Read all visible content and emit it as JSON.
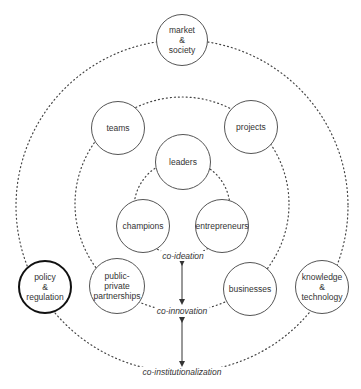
{
  "nodes": [
    {
      "id": "market",
      "label": "market\n&\nsociety",
      "cx": 182,
      "cy": 40,
      "r": 26,
      "thick": false
    },
    {
      "id": "teams",
      "label": "teams",
      "cx": 118,
      "cy": 128,
      "r": 27,
      "thick": false
    },
    {
      "id": "projects",
      "label": "projects",
      "cx": 251,
      "cy": 127,
      "r": 27,
      "thick": false
    },
    {
      "id": "leaders",
      "label": "leaders",
      "cx": 183,
      "cy": 162,
      "r": 28,
      "thick": false
    },
    {
      "id": "champions",
      "label": "champions",
      "cx": 143,
      "cy": 226,
      "r": 27,
      "thick": false
    },
    {
      "id": "entrepreneurs",
      "label": "entrepreneurs",
      "cx": 222,
      "cy": 226,
      "r": 27,
      "thick": false
    },
    {
      "id": "ppp",
      "label": "public-\nprivate\npartnerships",
      "cx": 117,
      "cy": 286,
      "r": 28,
      "thick": false
    },
    {
      "id": "businesses",
      "label": "businesses",
      "cx": 250,
      "cy": 289,
      "r": 27,
      "thick": false
    },
    {
      "id": "policy",
      "label": "policy\n&\nregulation",
      "cx": 45,
      "cy": 287,
      "r": 27,
      "thick": true
    },
    {
      "id": "knowledge",
      "label": "knowledge\n&\ntechnology",
      "cx": 322,
      "cy": 287,
      "r": 27,
      "thick": false
    }
  ],
  "labels": [
    {
      "id": "co-ideation",
      "text": "co-ideation",
      "x": 183,
      "y": 256
    },
    {
      "id": "co-innovation",
      "text": "co-innovation",
      "x": 182,
      "y": 311
    },
    {
      "id": "co-institutionalization",
      "text": "co-institutionalization",
      "x": 182,
      "y": 372
    }
  ],
  "rings": [
    {
      "id": "inner",
      "cx": 182,
      "cy": 208,
      "r": 48
    },
    {
      "id": "middle",
      "cx": 182,
      "cy": 204,
      "r": 107
    },
    {
      "id": "outer",
      "cx": 182,
      "cy": 206,
      "r": 166
    }
  ],
  "arrows": [
    {
      "x": 182,
      "y1": 263,
      "y2": 302
    },
    {
      "x": 182,
      "y1": 320,
      "y2": 364
    }
  ]
}
